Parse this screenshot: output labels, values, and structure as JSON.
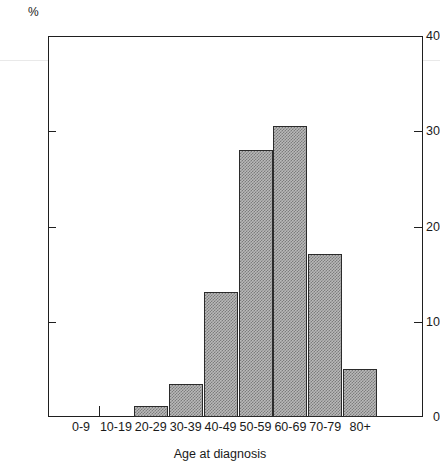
{
  "chart_data": {
    "type": "bar",
    "title": "",
    "subtitle": "",
    "xlabel": "Age at diagnosis",
    "ylabel": "%",
    "y_unit_label": "%",
    "categories": [
      "0-9",
      "10-19",
      "20-29",
      "30-39",
      "40-49",
      "50-59",
      "60-69",
      "70-79",
      "80+"
    ],
    "values": [
      0,
      0,
      1.2,
      3.5,
      13.1,
      28.0,
      30.6,
      17.1,
      5.0
    ],
    "ylim": [
      0,
      40
    ],
    "yticks": [
      0,
      10,
      20,
      30,
      40
    ],
    "ytick_labels": [
      "0",
      "10",
      "20",
      "30",
      "40"
    ],
    "grid": false,
    "legend": false,
    "legend_position": "none",
    "bar_fill": "#b9b9b9",
    "bar_edge": "#2b2b2b",
    "axis_color": "#1f1f1f",
    "background": "#ffffff"
  }
}
